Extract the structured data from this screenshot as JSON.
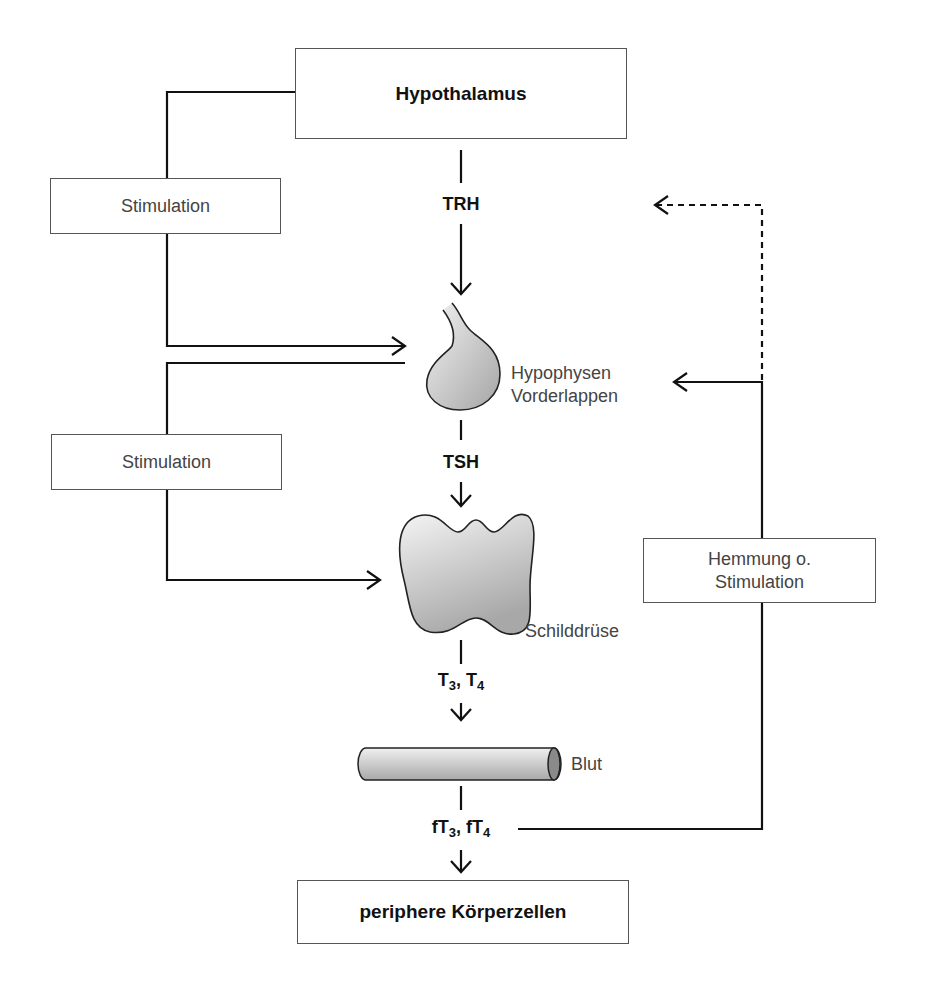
{
  "diagram": {
    "nodes": {
      "hypothalamus": "Hypothalamus",
      "hypophyse_line1": "Hypophysen",
      "hypophyse_line2": "Vorderlappen",
      "schilddruese": "Schilddrüse",
      "blut": "Blut",
      "koerperzellen": "periphere Körperzellen"
    },
    "hormones": {
      "trh": "TRH",
      "tsh": "TSH",
      "t3_t4": {
        "a": "T",
        "a_sub": "3",
        "sep": ", ",
        "b": "T",
        "b_sub": "4"
      },
      "ft3_ft4": {
        "a": "fT",
        "a_sub": "3",
        "sep": ", ",
        "b": "fT",
        "b_sub": "4"
      }
    },
    "edge_labels": {
      "stim1": "Stimulation",
      "stim2": "Stimulation",
      "feedback_line1": "Hemmung o.",
      "feedback_line2": "Stimulation"
    },
    "colors": {
      "line": "#111111",
      "box_border": "#555555",
      "organ_fill_light": "#efefef",
      "organ_fill_dark": "#a8a8a8"
    }
  }
}
